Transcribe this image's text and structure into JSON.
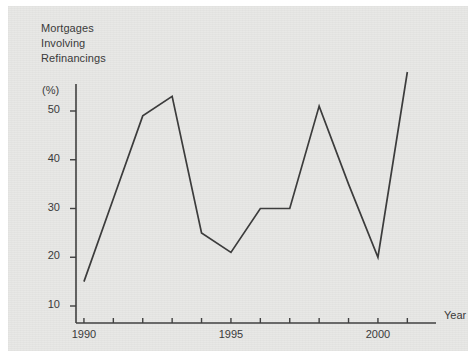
{
  "figure": {
    "title_lines": [
      "Mortgages",
      "Involving",
      "Refinancings"
    ],
    "unit_label": "(%)",
    "xaxis_label": "Year",
    "background_color": "#e8e8e6",
    "line_color": "#3c3c3c",
    "axis_color": "#404040",
    "text_color": "#3a3a3a"
  },
  "chart_data": {
    "type": "line",
    "title": "Mortgages Involving Refinancings",
    "xlabel": "Year",
    "ylabel": "(%)",
    "xlim": [
      1989.3,
      1991.5
    ],
    "ylim": [
      8,
      60
    ],
    "grid": false,
    "legend": null,
    "xticks": [
      1990,
      1991,
      1992,
      1993,
      1994,
      1995,
      1996,
      1997,
      1998,
      1999,
      2000,
      2001
    ],
    "xtick_labels": [
      "1990",
      "",
      "",
      "",
      "",
      "1995",
      "",
      "",
      "",
      "",
      "2000",
      ""
    ],
    "yticks": [
      10,
      20,
      30,
      40,
      50
    ],
    "ytick_labels": [
      "10",
      "20",
      "30",
      "40",
      "50"
    ],
    "x": [
      1990,
      1991,
      1992,
      1993,
      1994,
      1995,
      1996,
      1997,
      1998,
      1999,
      2000,
      2001
    ],
    "values": [
      15,
      32,
      49,
      53,
      25,
      21,
      30,
      30,
      51,
      35,
      20,
      58
    ],
    "series": [
      {
        "name": "Mortgages Involving Refinancings",
        "values": [
          15,
          32,
          49,
          53,
          25,
          21,
          30,
          30,
          51,
          35,
          20,
          58
        ]
      }
    ]
  }
}
